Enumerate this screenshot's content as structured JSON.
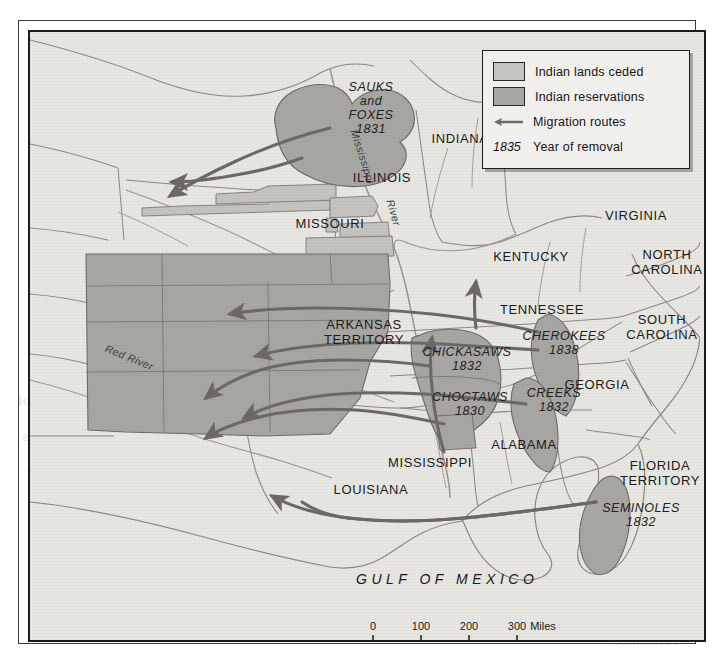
{
  "figure": {
    "gulf_label": "GULF OF MEXICO",
    "colors": {
      "ceded": "#c6c4c0",
      "reservations": "#a9a7a3",
      "paper": "#e9e7e2",
      "route": "#6d6a66",
      "border": "#1c1c1c",
      "state_line": "#8d8a85"
    }
  },
  "legend": {
    "items": [
      {
        "swatch": "ceded",
        "label": "Indian lands ceded"
      },
      {
        "swatch": "reservations",
        "label": "Indian reservations"
      },
      {
        "swatch": "arrow",
        "label": "Migration routes"
      },
      {
        "swatch": "year",
        "year": "1835",
        "label": "Year of removal"
      }
    ]
  },
  "states": [
    {
      "name": "INDIANA",
      "lines": [
        "INDIANA"
      ],
      "x": 430,
      "y": 106
    },
    {
      "name": "ILLINOIS",
      "lines": [
        "ILLINOIS"
      ],
      "x": 352,
      "y": 145
    },
    {
      "name": "MISSOURI",
      "lines": [
        "MISSOURI"
      ],
      "x": 300,
      "y": 191
    },
    {
      "name": "VIRGINIA",
      "lines": [
        "VIRGINIA"
      ],
      "x": 606,
      "y": 183
    },
    {
      "name": "KENTUCKY",
      "lines": [
        "KENTUCKY"
      ],
      "x": 501,
      "y": 224
    },
    {
      "name": "TENNESSEE",
      "lines": [
        "TENNESSEE"
      ],
      "x": 512,
      "y": 277
    },
    {
      "name": "NORTH CAROLINA",
      "lines": [
        "NORTH",
        "CAROLINA"
      ],
      "x": 637,
      "y": 230
    },
    {
      "name": "SOUTH CAROLINA",
      "lines": [
        "SOUTH",
        "CAROLINA"
      ],
      "x": 632,
      "y": 295
    },
    {
      "name": "ARKANSAS TERRITORY",
      "lines": [
        "ARKANSAS",
        "TERRITORY"
      ],
      "x": 334,
      "y": 300
    },
    {
      "name": "GEORGIA",
      "lines": [
        "GEORGIA"
      ],
      "x": 567,
      "y": 352
    },
    {
      "name": "ALABAMA",
      "lines": [
        "ALABAMA"
      ],
      "x": 494,
      "y": 412
    },
    {
      "name": "MISSISSIPPI",
      "lines": [
        "MISSISSIPPI"
      ],
      "x": 400,
      "y": 430
    },
    {
      "name": "LOUISIANA",
      "lines": [
        "LOUISIANA"
      ],
      "x": 341,
      "y": 457
    },
    {
      "name": "FLORIDA TERRITORY",
      "lines": [
        "FLORIDA",
        "TERRITORY"
      ],
      "x": 630,
      "y": 441
    }
  ],
  "tribes": [
    {
      "name": "SAUKS and FOXES",
      "lines": [
        "SAUKS",
        "and",
        "FOXES"
      ],
      "year": "1831",
      "x": 341,
      "y": 76
    },
    {
      "name": "CHICKASAWS",
      "lines": [
        "CHICKASAWS"
      ],
      "year": "1832",
      "x": 437,
      "y": 327
    },
    {
      "name": "CHOCTAWS",
      "lines": [
        "CHOCTAWS"
      ],
      "year": "1830",
      "x": 440,
      "y": 372
    },
    {
      "name": "CHEROKEES",
      "lines": [
        "CHEROKEES"
      ],
      "year": "1838",
      "x": 534,
      "y": 311
    },
    {
      "name": "CREEKS",
      "lines": [
        "CREEKS"
      ],
      "year": "1832",
      "x": 524,
      "y": 368
    },
    {
      "name": "SEMINOLES",
      "lines": [
        "SEMINOLES"
      ],
      "year": "1832",
      "x": 611,
      "y": 483
    }
  ],
  "rivers": [
    {
      "name": "Mississippi River",
      "part1": "Mississippi",
      "part2": "River"
    },
    {
      "name": "Red River",
      "label": "Red River"
    }
  ],
  "scalebar": {
    "miles": {
      "ticks": [
        "0",
        "100",
        "200",
        "300"
      ],
      "unit": "Miles"
    },
    "kilometers": {
      "ticks": [
        "0",
        "100",
        "200",
        "300"
      ],
      "unit": "Kilometers"
    }
  },
  "bleed_text": [
    {
      "text": "the eastern half",
      "x": 28,
      "y": 356
    },
    {
      "text": "of the Mississippi",
      "x": 18,
      "y": 392
    },
    {
      "text": "removal to lands",
      "x": 22,
      "y": 428
    },
    {
      "text": "west of the river",
      "x": 26,
      "y": 464
    },
    {
      "text": "and treaties",
      "x": 606,
      "y": 596
    },
    {
      "text": "resistance",
      "x": 614,
      "y": 632
    }
  ]
}
